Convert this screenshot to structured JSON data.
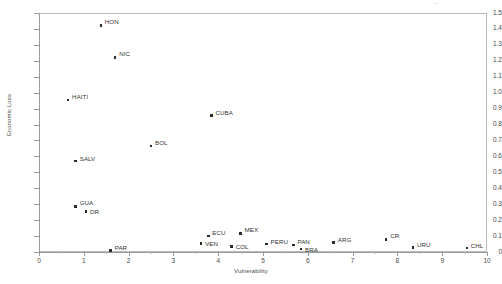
{
  "chart_data": {
    "type": "scatter",
    "title": "",
    "xlabel": "Vulnerability",
    "ylabel": "Economic Loss",
    "xlim": [
      0,
      10
    ],
    "ylim": [
      0,
      1.5
    ],
    "grid": false,
    "legend": false,
    "xticks": [
      "0",
      "1",
      "2",
      "3",
      "4",
      "5",
      "6",
      "7",
      "8",
      "9",
      "10"
    ],
    "yticks": [
      "0",
      "0.1",
      "0.2",
      "0.3",
      "0.4",
      "0.5",
      "0.6",
      "0.7",
      "0.8",
      "0.9",
      "1.0",
      "1.1",
      "1.2",
      "1.3",
      "1.4",
      "1.5"
    ],
    "points": [
      {
        "label": "HON",
        "x": 1.38,
        "y": 1.42
      },
      {
        "label": "NIC",
        "x": 1.7,
        "y": 1.22
      },
      {
        "label": "HAITI",
        "x": 0.65,
        "y": 0.955
      },
      {
        "label": "CUBA",
        "x": 3.85,
        "y": 0.855
      },
      {
        "label": "BOL",
        "x": 2.5,
        "y": 0.665
      },
      {
        "label": "SALV",
        "x": 0.82,
        "y": 0.57
      },
      {
        "label": "GUA",
        "x": 0.82,
        "y": 0.285
      },
      {
        "label": "DR",
        "x": 1.05,
        "y": 0.255
      },
      {
        "label": "MEX",
        "x": 4.5,
        "y": 0.115
      },
      {
        "label": "ECU",
        "x": 3.78,
        "y": 0.1
      },
      {
        "label": "CR",
        "x": 7.75,
        "y": 0.08
      },
      {
        "label": "ARG",
        "x": 6.58,
        "y": 0.06
      },
      {
        "label": "VEN",
        "x": 3.62,
        "y": 0.055
      },
      {
        "label": "PERU",
        "x": 5.08,
        "y": 0.05
      },
      {
        "label": "PAN",
        "x": 5.68,
        "y": 0.045
      },
      {
        "label": "COL",
        "x": 4.3,
        "y": 0.035
      },
      {
        "label": "URU",
        "x": 8.35,
        "y": 0.03
      },
      {
        "label": "CHL",
        "x": 9.55,
        "y": 0.025
      },
      {
        "label": "BRA",
        "x": 5.85,
        "y": 0.02
      },
      {
        "label": "PAR",
        "x": 1.6,
        "y": 0.01
      }
    ],
    "colors": {
      "marker": "#2b2b2b",
      "axis": "#9a9a9a",
      "frame": "#b9b9b9",
      "text": "#4a4a4a"
    }
  },
  "artifact": {
    "mark": "~"
  }
}
